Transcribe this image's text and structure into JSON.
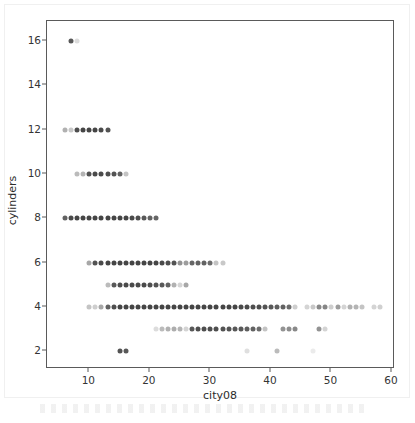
{
  "chart_data": {
    "type": "scatter",
    "title": "",
    "xlabel": "city08",
    "ylabel": "cylinders",
    "xlim": [
      3,
      60.5
    ],
    "ylim": [
      1.2,
      16.9
    ],
    "xticks": [
      10,
      20,
      30,
      40,
      50,
      60
    ],
    "yticks": [
      2,
      4,
      6,
      8,
      10,
      12,
      14,
      16
    ],
    "xtick_labels": [
      "10",
      "20",
      "30",
      "40",
      "50",
      "60"
    ],
    "ytick_labels": [
      "2",
      "4",
      "6",
      "8",
      "10",
      "12",
      "14",
      "16"
    ],
    "grid": false,
    "legend": null,
    "marker": "circle",
    "marker_color": "#3b3b3b",
    "frame_color": "#5a5a5a",
    "background": "#ffffff",
    "note": "alpha of each marker encodes overplotted record count; opacity listed per point",
    "series": [
      {
        "name": "vehicles",
        "points": [
          {
            "x": 7,
            "y": 16,
            "alpha": 0.85
          },
          {
            "x": 8,
            "y": 16,
            "alpha": 0.18
          },
          {
            "x": 6,
            "y": 12,
            "alpha": 0.4
          },
          {
            "x": 7,
            "y": 12,
            "alpha": 0.28
          },
          {
            "x": 8,
            "y": 12,
            "alpha": 0.9
          },
          {
            "x": 9,
            "y": 12,
            "alpha": 0.95
          },
          {
            "x": 10,
            "y": 12,
            "alpha": 0.95
          },
          {
            "x": 11,
            "y": 12,
            "alpha": 0.95
          },
          {
            "x": 12,
            "y": 12,
            "alpha": 0.92
          },
          {
            "x": 13,
            "y": 12,
            "alpha": 0.88
          },
          {
            "x": 8,
            "y": 10,
            "alpha": 0.35
          },
          {
            "x": 9,
            "y": 10,
            "alpha": 0.38
          },
          {
            "x": 10,
            "y": 10,
            "alpha": 0.88
          },
          {
            "x": 11,
            "y": 10,
            "alpha": 0.92
          },
          {
            "x": 12,
            "y": 10,
            "alpha": 0.92
          },
          {
            "x": 13,
            "y": 10,
            "alpha": 0.9
          },
          {
            "x": 14,
            "y": 10,
            "alpha": 0.88
          },
          {
            "x": 15,
            "y": 10,
            "alpha": 0.8
          },
          {
            "x": 16,
            "y": 10,
            "alpha": 0.3
          },
          {
            "x": 6,
            "y": 8,
            "alpha": 0.8
          },
          {
            "x": 7,
            "y": 8,
            "alpha": 0.92
          },
          {
            "x": 8,
            "y": 8,
            "alpha": 0.95
          },
          {
            "x": 9,
            "y": 8,
            "alpha": 0.95
          },
          {
            "x": 10,
            "y": 8,
            "alpha": 0.95
          },
          {
            "x": 11,
            "y": 8,
            "alpha": 0.95
          },
          {
            "x": 12,
            "y": 8,
            "alpha": 0.95
          },
          {
            "x": 13,
            "y": 8,
            "alpha": 0.95
          },
          {
            "x": 14,
            "y": 8,
            "alpha": 0.95
          },
          {
            "x": 15,
            "y": 8,
            "alpha": 0.95
          },
          {
            "x": 16,
            "y": 8,
            "alpha": 0.95
          },
          {
            "x": 17,
            "y": 8,
            "alpha": 0.92
          },
          {
            "x": 18,
            "y": 8,
            "alpha": 0.9
          },
          {
            "x": 19,
            "y": 8,
            "alpha": 0.85
          },
          {
            "x": 20,
            "y": 8,
            "alpha": 0.8
          },
          {
            "x": 21,
            "y": 8,
            "alpha": 0.78
          },
          {
            "x": 10,
            "y": 6,
            "alpha": 0.45
          },
          {
            "x": 11,
            "y": 6,
            "alpha": 0.88
          },
          {
            "x": 12,
            "y": 6,
            "alpha": 0.92
          },
          {
            "x": 13,
            "y": 6,
            "alpha": 0.95
          },
          {
            "x": 14,
            "y": 6,
            "alpha": 0.95
          },
          {
            "x": 15,
            "y": 6,
            "alpha": 0.95
          },
          {
            "x": 16,
            "y": 6,
            "alpha": 0.95
          },
          {
            "x": 17,
            "y": 6,
            "alpha": 0.95
          },
          {
            "x": 18,
            "y": 6,
            "alpha": 0.95
          },
          {
            "x": 19,
            "y": 6,
            "alpha": 0.95
          },
          {
            "x": 20,
            "y": 6,
            "alpha": 0.95
          },
          {
            "x": 21,
            "y": 6,
            "alpha": 0.95
          },
          {
            "x": 22,
            "y": 6,
            "alpha": 0.92
          },
          {
            "x": 23,
            "y": 6,
            "alpha": 0.9
          },
          {
            "x": 24,
            "y": 6,
            "alpha": 0.88
          },
          {
            "x": 25,
            "y": 6,
            "alpha": 0.55
          },
          {
            "x": 26,
            "y": 6,
            "alpha": 0.5
          },
          {
            "x": 27,
            "y": 6,
            "alpha": 0.78
          },
          {
            "x": 28,
            "y": 6,
            "alpha": 0.8
          },
          {
            "x": 29,
            "y": 6,
            "alpha": 0.8
          },
          {
            "x": 30,
            "y": 6,
            "alpha": 0.75
          },
          {
            "x": 31,
            "y": 6,
            "alpha": 0.3
          },
          {
            "x": 32,
            "y": 6,
            "alpha": 0.28
          },
          {
            "x": 13,
            "y": 5,
            "alpha": 0.35
          },
          {
            "x": 14,
            "y": 5,
            "alpha": 0.85
          },
          {
            "x": 15,
            "y": 5,
            "alpha": 0.9
          },
          {
            "x": 16,
            "y": 5,
            "alpha": 0.92
          },
          {
            "x": 17,
            "y": 5,
            "alpha": 0.92
          },
          {
            "x": 18,
            "y": 5,
            "alpha": 0.92
          },
          {
            "x": 19,
            "y": 5,
            "alpha": 0.92
          },
          {
            "x": 20,
            "y": 5,
            "alpha": 0.9
          },
          {
            "x": 21,
            "y": 5,
            "alpha": 0.88
          },
          {
            "x": 22,
            "y": 5,
            "alpha": 0.85
          },
          {
            "x": 23,
            "y": 5,
            "alpha": 0.8
          },
          {
            "x": 24,
            "y": 5,
            "alpha": 0.4
          },
          {
            "x": 25,
            "y": 5,
            "alpha": 0.22
          },
          {
            "x": 26,
            "y": 5,
            "alpha": 0.45
          },
          {
            "x": 10,
            "y": 4,
            "alpha": 0.3
          },
          {
            "x": 11,
            "y": 4,
            "alpha": 0.25
          },
          {
            "x": 12,
            "y": 4,
            "alpha": 0.45
          },
          {
            "x": 13,
            "y": 4,
            "alpha": 0.8
          },
          {
            "x": 14,
            "y": 4,
            "alpha": 0.9
          },
          {
            "x": 15,
            "y": 4,
            "alpha": 0.95
          },
          {
            "x": 16,
            "y": 4,
            "alpha": 0.95
          },
          {
            "x": 17,
            "y": 4,
            "alpha": 0.95
          },
          {
            "x": 18,
            "y": 4,
            "alpha": 0.95
          },
          {
            "x": 19,
            "y": 4,
            "alpha": 0.95
          },
          {
            "x": 20,
            "y": 4,
            "alpha": 0.95
          },
          {
            "x": 21,
            "y": 4,
            "alpha": 0.95
          },
          {
            "x": 22,
            "y": 4,
            "alpha": 0.95
          },
          {
            "x": 23,
            "y": 4,
            "alpha": 0.95
          },
          {
            "x": 24,
            "y": 4,
            "alpha": 0.95
          },
          {
            "x": 25,
            "y": 4,
            "alpha": 0.95
          },
          {
            "x": 26,
            "y": 4,
            "alpha": 0.95
          },
          {
            "x": 27,
            "y": 4,
            "alpha": 0.95
          },
          {
            "x": 28,
            "y": 4,
            "alpha": 0.95
          },
          {
            "x": 29,
            "y": 4,
            "alpha": 0.95
          },
          {
            "x": 30,
            "y": 4,
            "alpha": 0.95
          },
          {
            "x": 31,
            "y": 4,
            "alpha": 0.95
          },
          {
            "x": 32,
            "y": 4,
            "alpha": 0.95
          },
          {
            "x": 33,
            "y": 4,
            "alpha": 0.95
          },
          {
            "x": 34,
            "y": 4,
            "alpha": 0.95
          },
          {
            "x": 35,
            "y": 4,
            "alpha": 0.92
          },
          {
            "x": 36,
            "y": 4,
            "alpha": 0.92
          },
          {
            "x": 37,
            "y": 4,
            "alpha": 0.9
          },
          {
            "x": 38,
            "y": 4,
            "alpha": 0.9
          },
          {
            "x": 39,
            "y": 4,
            "alpha": 0.88
          },
          {
            "x": 40,
            "y": 4,
            "alpha": 0.85
          },
          {
            "x": 41,
            "y": 4,
            "alpha": 0.82
          },
          {
            "x": 42,
            "y": 4,
            "alpha": 0.8
          },
          {
            "x": 43,
            "y": 4,
            "alpha": 0.75
          },
          {
            "x": 44,
            "y": 4,
            "alpha": 0.25
          },
          {
            "x": 46,
            "y": 4,
            "alpha": 0.22
          },
          {
            "x": 47,
            "y": 4,
            "alpha": 0.28
          },
          {
            "x": 48,
            "y": 4,
            "alpha": 0.6
          },
          {
            "x": 49,
            "y": 4,
            "alpha": 0.62
          },
          {
            "x": 50,
            "y": 4,
            "alpha": 0.25
          },
          {
            "x": 51,
            "y": 4,
            "alpha": 0.5
          },
          {
            "x": 52,
            "y": 4,
            "alpha": 0.22
          },
          {
            "x": 53,
            "y": 4,
            "alpha": 0.4
          },
          {
            "x": 54,
            "y": 4,
            "alpha": 0.38
          },
          {
            "x": 55,
            "y": 4,
            "alpha": 0.3
          },
          {
            "x": 57,
            "y": 4,
            "alpha": 0.22
          },
          {
            "x": 58,
            "y": 4,
            "alpha": 0.24
          },
          {
            "x": 21,
            "y": 3,
            "alpha": 0.18
          },
          {
            "x": 22,
            "y": 3,
            "alpha": 0.35
          },
          {
            "x": 23,
            "y": 3,
            "alpha": 0.4
          },
          {
            "x": 24,
            "y": 3,
            "alpha": 0.42
          },
          {
            "x": 25,
            "y": 3,
            "alpha": 0.38
          },
          {
            "x": 26,
            "y": 3,
            "alpha": 0.22
          },
          {
            "x": 27,
            "y": 3,
            "alpha": 0.85
          },
          {
            "x": 28,
            "y": 3,
            "alpha": 0.9
          },
          {
            "x": 29,
            "y": 3,
            "alpha": 0.9
          },
          {
            "x": 30,
            "y": 3,
            "alpha": 0.9
          },
          {
            "x": 31,
            "y": 3,
            "alpha": 0.9
          },
          {
            "x": 32,
            "y": 3,
            "alpha": 0.88
          },
          {
            "x": 33,
            "y": 3,
            "alpha": 0.88
          },
          {
            "x": 34,
            "y": 3,
            "alpha": 0.85
          },
          {
            "x": 35,
            "y": 3,
            "alpha": 0.85
          },
          {
            "x": 36,
            "y": 3,
            "alpha": 0.82
          },
          {
            "x": 37,
            "y": 3,
            "alpha": 0.8
          },
          {
            "x": 38,
            "y": 3,
            "alpha": 0.75
          },
          {
            "x": 39,
            "y": 3,
            "alpha": 0.3
          },
          {
            "x": 42,
            "y": 3,
            "alpha": 0.55
          },
          {
            "x": 43,
            "y": 3,
            "alpha": 0.58
          },
          {
            "x": 44,
            "y": 3,
            "alpha": 0.6
          },
          {
            "x": 48,
            "y": 3,
            "alpha": 0.55
          },
          {
            "x": 49,
            "y": 3,
            "alpha": 0.22
          },
          {
            "x": 15,
            "y": 2,
            "alpha": 0.88
          },
          {
            "x": 16,
            "y": 2,
            "alpha": 0.85
          },
          {
            "x": 36,
            "y": 2,
            "alpha": 0.16
          },
          {
            "x": 41,
            "y": 2,
            "alpha": 0.35
          },
          {
            "x": 47,
            "y": 2,
            "alpha": 0.1
          }
        ]
      }
    ]
  }
}
